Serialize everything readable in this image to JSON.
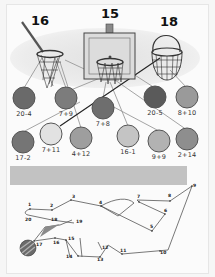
{
  "worksheet": {
    "hoops": [
      {
        "id": "net-pole",
        "number": "16",
        "x": 40,
        "y": 15
      },
      {
        "id": "backboard",
        "number": "15",
        "x": 108,
        "y": 8
      },
      {
        "id": "basket",
        "number": "18",
        "x": 169,
        "y": 17
      }
    ],
    "balls": [
      {
        "expr": "20-4",
        "x": 24,
        "y": 98,
        "color": "#6a6a6a"
      },
      {
        "expr": "7+9",
        "x": 66,
        "y": 98,
        "color": "#7c7c7c"
      },
      {
        "expr": "7+8",
        "x": 103,
        "y": 108,
        "color": "#6e6e6e"
      },
      {
        "expr": "20-5",
        "x": 155,
        "y": 97,
        "color": "#5a5a5a"
      },
      {
        "expr": "8+10",
        "x": 187,
        "y": 97,
        "color": "#9a9a9a"
      },
      {
        "expr": "17-2",
        "x": 23,
        "y": 142,
        "color": "#757575"
      },
      {
        "expr": "7+11",
        "x": 51,
        "y": 134,
        "color": "#e2e2e2"
      },
      {
        "expr": "4+12",
        "x": 81,
        "y": 138,
        "color": "#9e9e9e"
      },
      {
        "expr": "16-1",
        "x": 128,
        "y": 136,
        "color": "#c4c4c4"
      },
      {
        "expr": "9+9",
        "x": 159,
        "y": 141,
        "color": "#b2b2b2"
      },
      {
        "expr": "2+14",
        "x": 187,
        "y": 139,
        "color": "#8e8e8e"
      }
    ],
    "answer_band": {
      "color": "#c2c2c2"
    },
    "dot_to_dot": {
      "numbers": [
        "1",
        "2",
        "3",
        "4",
        "5",
        "6",
        "7",
        "8",
        "9",
        "10",
        "11",
        "12",
        "13",
        "14",
        "15",
        "16",
        "17",
        "18",
        "19",
        "20"
      ]
    }
  }
}
